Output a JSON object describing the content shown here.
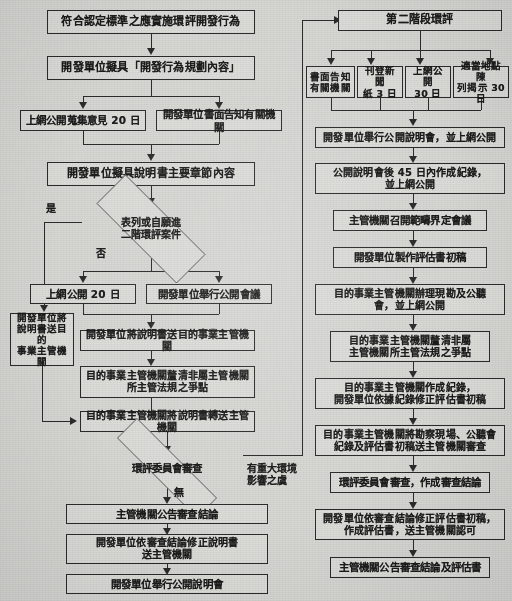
{
  "document": {
    "title": "環境影響評估作業流程圖",
    "language": "zh-Hant",
    "background_color": "#d7d7d4",
    "line_color": "#2b2b2b",
    "box_fill_color": "#dcdcd9"
  },
  "left_flow": {
    "n1": "符合認定標準之應實施環評開發行為",
    "n2": "開發單位擬具「開發行為規劃內容」",
    "n3": "上網公開蒐集意見 20 日",
    "n4": "開發單位書面告知有關機關",
    "n5": "開發單位擬具說明書主要章節內容",
    "d1": "表列或自願進\n二階環評案件",
    "d1_yes": "是",
    "d1_no": "否",
    "n6": "上網公開 20 日",
    "n7": "開發單位舉行公開會議",
    "n8": "開發單位將\n說明書送目的\n事業主管機關",
    "n9": "開發單位將說明書送目的事業主管機關",
    "n10": "目的事業主管機關釐清非屬主管機關\n所主管法規之爭點",
    "n11": "目的事業主管機關將說明書轉送主管機關",
    "d2": "環評委員會審查",
    "d2_none": "無",
    "d2_major": "有重大環境\n影響之虞",
    "n12": "主管機關公告審查結論",
    "n13": "開發單位依審查結論修正說明書\n送主管機關",
    "n14": "開發單位舉行公開說明會"
  },
  "right_flow": {
    "r1": "第二階段環評",
    "r2a": "書面告知\n有關機關",
    "r2b": "刊登新聞\n紙 3 日",
    "r2c": "上網公開\n30 日",
    "r2d": "適當地點陳\n列揭示 30 日",
    "r3": "開發單位舉行公開說明會，並上網公開",
    "r4": "公開說明會後 45 日內作成紀錄，\n並上網公開",
    "r5": "主管機關召開範疇界定會議",
    "r6": "開發單位製作評估書初稿",
    "r7": "目的事業主管機關辦理現勘及公聽\n會，並上網公開",
    "r8": "目的事業主管機關釐清非屬\n主管機關所主管法規之爭點",
    "r9": "目的事業主管機關作成紀錄，\n開發單位依據紀錄修正評估書初稿",
    "r10": "目的事業主管機關將勘察現場、公聽會\n紀錄及評估書初稿送主管機關審查",
    "r11": "環評委員會審查，作成審查結論",
    "r12": "開發單位依審查結論修正評估書初稿，\n作成評估書，送主管機關認可",
    "r13": "主管機關公告審查結論及評估書"
  }
}
